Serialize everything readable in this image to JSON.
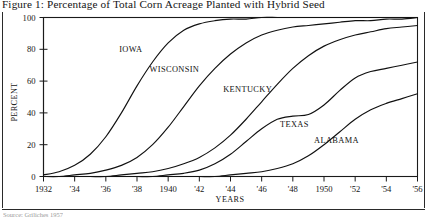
{
  "figure": {
    "caption": "Figure 1: Percentage of Total Corn Acreage Planted with Hybrid Seed",
    "footer_note": "Source: Griliches 1957"
  },
  "chart_data": {
    "type": "line",
    "title": "Figure 1: Percentage of Total Corn Acreage Planted with Hybrid Seed",
    "xlabel": "YEARS",
    "ylabel": "PERCENT",
    "xlim": [
      1932,
      1956
    ],
    "ylim": [
      0,
      100
    ],
    "grid": false,
    "legend_position": "inline-annotations",
    "x_tick_labels": [
      "1932",
      "'34",
      "'36",
      "'38",
      "1940",
      "'42",
      "'44",
      "'46",
      "'48",
      "1950",
      "'52",
      "'54",
      "'56"
    ],
    "x_tick_values": [
      1932,
      1934,
      1936,
      1938,
      1940,
      1942,
      1944,
      1946,
      1948,
      1950,
      1952,
      1954,
      1956
    ],
    "y_tick_labels": [
      "0",
      "20",
      "40",
      "60",
      "80",
      "100"
    ],
    "y_tick_values": [
      0,
      20,
      40,
      60,
      80,
      100
    ],
    "x": [
      1932,
      1933,
      1934,
      1935,
      1936,
      1937,
      1938,
      1939,
      1940,
      1941,
      1942,
      1943,
      1944,
      1945,
      1946,
      1947,
      1948,
      1949,
      1950,
      1951,
      1952,
      1953,
      1954,
      1955,
      1956
    ],
    "series": [
      {
        "name": "IOWA",
        "label": "IOWA",
        "label_x": 1937.6,
        "label_y": 78,
        "values": [
          1,
          3,
          7,
          14,
          25,
          40,
          57,
          72,
          84,
          92,
          96,
          98,
          99,
          99,
          100,
          100,
          100,
          100,
          100,
          100,
          100,
          100,
          100,
          100,
          100
        ]
      },
      {
        "name": "WISCONSIN",
        "label": "WISCONSIN",
        "label_x": 1940.4,
        "label_y": 66,
        "values": [
          0,
          0,
          1,
          2,
          4,
          7,
          12,
          20,
          31,
          44,
          57,
          68,
          77,
          84,
          89,
          92,
          94,
          95,
          96,
          97,
          98,
          98,
          99,
          99,
          100
        ]
      },
      {
        "name": "KENTUCKY",
        "label": "KENTUCKY",
        "label_x": 1945.1,
        "label_y": 53,
        "values": [
          0,
          0,
          0,
          0,
          0,
          1,
          2,
          3,
          5,
          8,
          12,
          18,
          26,
          36,
          47,
          58,
          68,
          76,
          82,
          86,
          89,
          91,
          93,
          94,
          95
        ]
      },
      {
        "name": "TEXAS",
        "label": "TEXAS",
        "label_x": 1948.1,
        "label_y": 31,
        "values": [
          0,
          0,
          0,
          0,
          0,
          0,
          0,
          0,
          1,
          2,
          4,
          8,
          14,
          22,
          30,
          36,
          38,
          39,
          45,
          54,
          62,
          66,
          68,
          70,
          72
        ]
      },
      {
        "name": "ALABAMA",
        "label": "ALABAMA",
        "label_x": 1950.8,
        "label_y": 21,
        "values": [
          0,
          0,
          0,
          0,
          0,
          0,
          0,
          0,
          0,
          0,
          0,
          0,
          1,
          2,
          3,
          5,
          8,
          13,
          20,
          28,
          36,
          42,
          46,
          49,
          52
        ]
      }
    ]
  },
  "colors": {
    "curve": "#111111",
    "axis": "#1a1a1a",
    "background": "#ffffff"
  }
}
